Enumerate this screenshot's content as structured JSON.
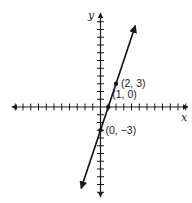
{
  "chart_data": {
    "type": "line",
    "title": "",
    "xlabel": "x",
    "ylabel": "y",
    "xlim": [
      -11,
      11
    ],
    "ylim": [
      -11,
      11
    ],
    "tick_step": 1,
    "tick_labels_shown": false,
    "grid": false,
    "series": [
      {
        "name": "line",
        "equation": "y = 3x - 3",
        "slope": 3,
        "intercept": -3,
        "x_range": [
          -2.5,
          4.5
        ],
        "color": "#1a1a1a",
        "arrows_both_ends": true
      }
    ],
    "points": [
      {
        "x": 2,
        "y": 3,
        "label": "(2, 3)"
      },
      {
        "x": 1,
        "y": 0,
        "label": "(1, 0)"
      },
      {
        "x": 0,
        "y": -3,
        "label": "(0, −3)"
      }
    ]
  }
}
